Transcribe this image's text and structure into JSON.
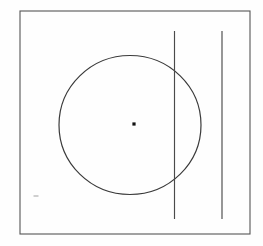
{
  "figure": {
    "canvas": {
      "width": 263,
      "height": 246,
      "background_color": "#fefefe"
    },
    "colors": {
      "stroke": "#444444",
      "frame_stroke": "#555555",
      "circle_stroke": "#3a3a3a",
      "line_stroke": "#4a4a4a",
      "dot_fill": "#111111",
      "smudge": "#cfcfcf",
      "background": "#fefefe"
    },
    "shapes": [
      {
        "name": "outer-frame",
        "type": "rectangle",
        "x": 20,
        "y": 11,
        "width": 230,
        "height": 223,
        "stroke_width": 1.1,
        "fill": "none"
      },
      {
        "name": "main-circle",
        "type": "ellipse",
        "cx": 130,
        "cy": 125,
        "rx": 71,
        "ry": 69.5,
        "stroke_width": 1.2,
        "fill": "none"
      },
      {
        "name": "circle-center-dot",
        "type": "dot",
        "cx": 134,
        "cy": 124,
        "size": 3.2
      },
      {
        "name": "vertical-line-left",
        "type": "line",
        "x1": 174.5,
        "y1": 31,
        "x2": 174.5,
        "y2": 219,
        "stroke_width": 1.15
      },
      {
        "name": "vertical-line-right",
        "type": "line",
        "x1": 222,
        "y1": 31,
        "x2": 222,
        "y2": 219,
        "stroke_width": 1.15
      },
      {
        "name": "faint-smudge",
        "type": "mark",
        "cx": 36,
        "cy": 196,
        "width": 5,
        "height": 2
      }
    ],
    "labels": {
      "caption": "",
      "annotations": []
    }
  }
}
